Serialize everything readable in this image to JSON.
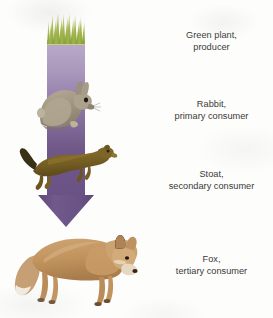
{
  "figure": {
    "background_color": "#fdfdfc"
  },
  "diagram": {
    "type": "food-chain-energy-flow",
    "direction": "top-to-bottom",
    "arrow": {
      "name": "energy-flow-arrow",
      "shaft_color_top": "#b4a4c4",
      "shaft_color_bottom": "#6a5286",
      "head_color": "#6b5585"
    },
    "grass": {
      "name": "grass-tuft",
      "blade_color_light": "#b7c96a",
      "blade_color_dark": "#7d9636"
    },
    "organisms": [
      {
        "name": "grass",
        "icon": "grass-icon",
        "color": "#8fa83f"
      },
      {
        "name": "rabbit",
        "icon": "rabbit-icon",
        "color": "#a79b87"
      },
      {
        "name": "stoat",
        "icon": "stoat-icon",
        "color": "#7a6326"
      },
      {
        "name": "fox",
        "icon": "fox-icon",
        "color": "#c49a6c"
      }
    ]
  },
  "labels": [
    {
      "line1": "Green plant,",
      "line2": "producer",
      "trophic_level": 1,
      "role": "producer"
    },
    {
      "line1": "Rabbit,",
      "line2": "primary consumer",
      "trophic_level": 2,
      "role": "primary consumer"
    },
    {
      "line1": "Stoat,",
      "line2": "secondary consumer",
      "trophic_level": 3,
      "role": "secondary consumer"
    },
    {
      "line1": "Fox,",
      "line2": "tertiary consumer",
      "trophic_level": 4,
      "role": "tertiary consumer"
    }
  ]
}
